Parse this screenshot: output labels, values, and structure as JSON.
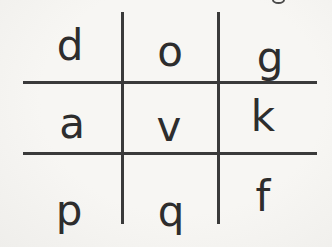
{
  "page": {
    "background_color": "#f5f4f1",
    "ink_color": "#2d2d2d",
    "grid_line_color": "#3a3a3a",
    "crop_mark": "partial-glyph-remnant"
  },
  "grid": {
    "rows": [
      {
        "cells": [
          "d",
          "o",
          "g"
        ]
      },
      {
        "cells": [
          "a",
          "v",
          "k"
        ]
      },
      {
        "cells": [
          "p",
          "q",
          "f"
        ]
      }
    ]
  }
}
